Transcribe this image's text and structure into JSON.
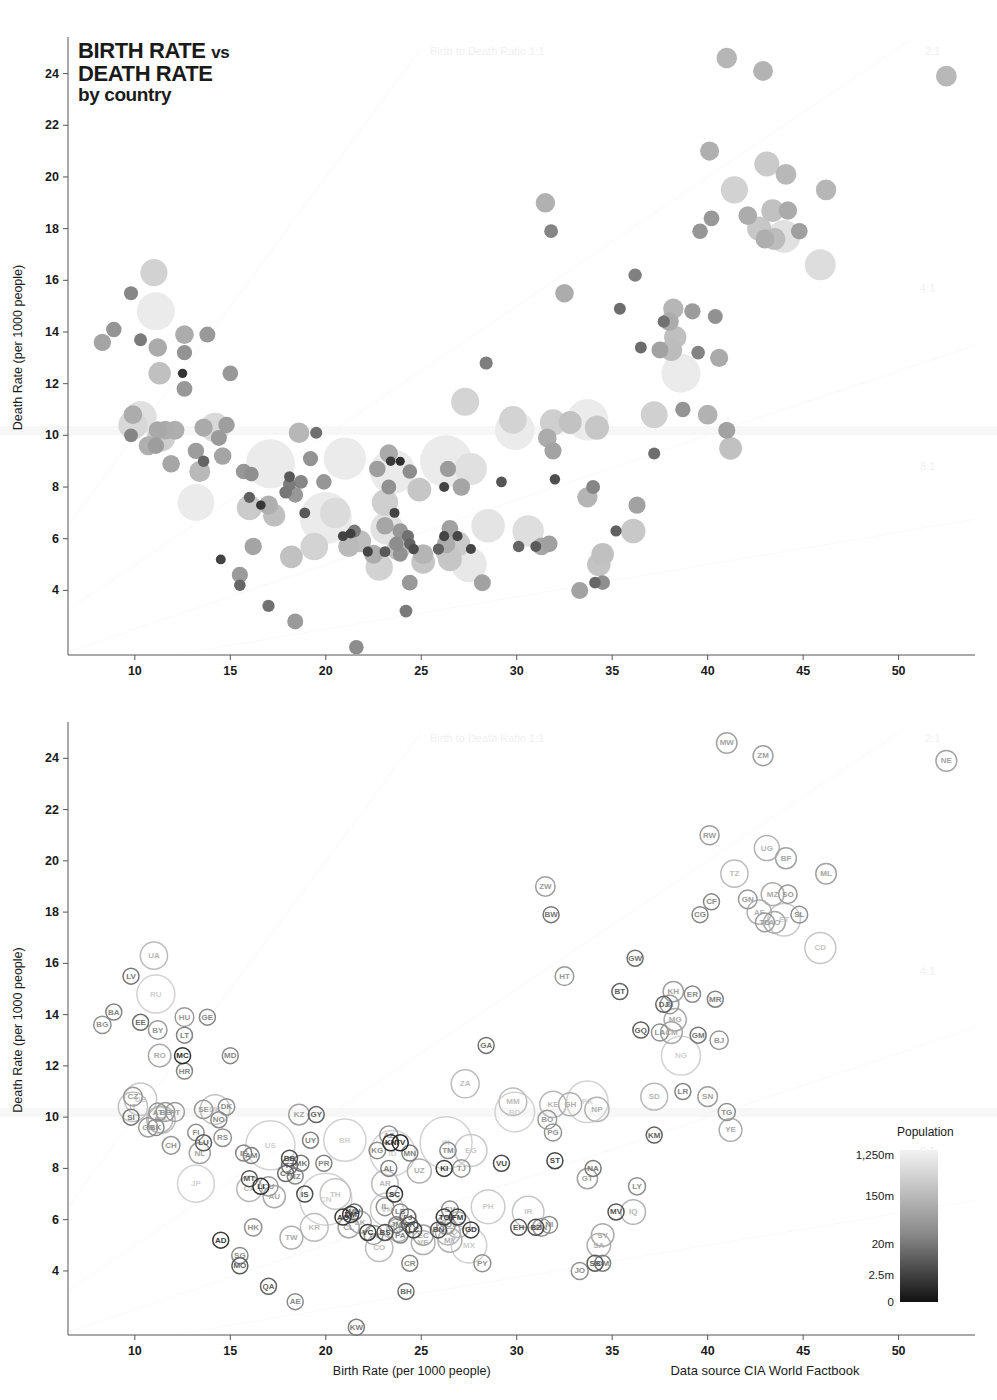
{
  "title": {
    "line1": "BIRTH RATE",
    "vs": "vs",
    "line2": "DEATH RATE",
    "line3": "by country"
  },
  "axes": {
    "x_label": "Birth Rate (per 1000 people)",
    "y_label": "Death Rate (per 1000 people)",
    "x_ticks": [
      10,
      15,
      20,
      25,
      30,
      35,
      40,
      45,
      50
    ],
    "y_ticks": [
      4,
      6,
      8,
      10,
      12,
      14,
      16,
      18,
      20,
      22,
      24
    ],
    "xlim": [
      6.5,
      54
    ],
    "ylim": [
      1.5,
      25.3
    ]
  },
  "source": "Data source CIA World Factbook",
  "ratio_lines": [
    {
      "label": "Birth to Death Ratio 1:1",
      "ratio": 1
    },
    {
      "label": "2:1",
      "ratio": 2
    },
    {
      "label": "4:1",
      "ratio": 4
    },
    {
      "label": "8:1",
      "ratio": 8
    }
  ],
  "legend": {
    "title": "Population",
    "ticks": [
      "1,250m",
      "150m",
      "20m",
      "2.5m",
      "0"
    ],
    "high_color": "#f2f2f2",
    "low_color": "#111111"
  },
  "chart_data": {
    "type": "scatter",
    "title": "BIRTH RATE vs DEATH RATE by country",
    "xlabel": "Birth Rate (per 1000 people)",
    "ylabel": "Death Rate (per 1000 people)",
    "size_encoding": "population",
    "color_encoding": "population (light = large, dark = small)",
    "grid": false,
    "legend_position": "bottom-right",
    "points": [
      {
        "code": "LV",
        "x": 9.8,
        "y": 15.5,
        "pop": 2.2
      },
      {
        "code": "UA",
        "x": 11.0,
        "y": 16.3,
        "pop": 45
      },
      {
        "code": "RU",
        "x": 11.1,
        "y": 14.8,
        "pop": 140
      },
      {
        "code": "BA",
        "x": 8.9,
        "y": 14.1,
        "pop": 3.9
      },
      {
        "code": "BG",
        "x": 8.3,
        "y": 13.6,
        "pop": 7.1
      },
      {
        "code": "EE",
        "x": 10.3,
        "y": 13.7,
        "pop": 1.3
      },
      {
        "code": "BY",
        "x": 11.2,
        "y": 13.4,
        "pop": 9.6
      },
      {
        "code": "HU",
        "x": 12.6,
        "y": 13.9,
        "pop": 10
      },
      {
        "code": "LT",
        "x": 12.6,
        "y": 13.2,
        "pop": 3.5
      },
      {
        "code": "GE",
        "x": 13.8,
        "y": 13.9,
        "pop": 4.6
      },
      {
        "code": "RO",
        "x": 11.3,
        "y": 12.4,
        "pop": 22
      },
      {
        "code": "MC",
        "x": 12.5,
        "y": 12.4,
        "pop": 0.03
      },
      {
        "code": "MD",
        "x": 15.0,
        "y": 12.4,
        "pop": 4.3
      },
      {
        "code": "HR",
        "x": 12.6,
        "y": 11.8,
        "pop": 4.4
      },
      {
        "code": "CZ",
        "x": 9.9,
        "y": 10.8,
        "pop": 10
      },
      {
        "code": "DE",
        "x": 10.3,
        "y": 10.7,
        "pop": 82
      },
      {
        "code": "IT",
        "x": 9.9,
        "y": 10.4,
        "pop": 58
      },
      {
        "code": "SI",
        "x": 9.8,
        "y": 10.0,
        "pop": 2
      },
      {
        "code": "GR",
        "x": 10.7,
        "y": 9.6,
        "pop": 11
      },
      {
        "code": "SK",
        "x": 11.1,
        "y": 9.6,
        "pop": 5.4
      },
      {
        "code": "AT",
        "x": 11.2,
        "y": 10.2,
        "pop": 8.2
      },
      {
        "code": "BE",
        "x": 11.6,
        "y": 10.2,
        "pop": 10.4
      },
      {
        "code": "PT",
        "x": 12.1,
        "y": 10.2,
        "pop": 10.6
      },
      {
        "code": "ES",
        "x": 11.4,
        "y": 9.9,
        "pop": 45
      },
      {
        "code": "PL",
        "x": 11.3,
        "y": 9.9,
        "pop": 38
      },
      {
        "code": "SE",
        "x": 13.6,
        "y": 10.3,
        "pop": 9.1
      },
      {
        "code": "UK",
        "x": 14.2,
        "y": 10.3,
        "pop": 61
      },
      {
        "code": "DK",
        "x": 14.8,
        "y": 10.4,
        "pop": 5.5
      },
      {
        "code": "NO",
        "x": 14.4,
        "y": 9.9,
        "pop": 4.7
      },
      {
        "code": "CH",
        "x": 11.9,
        "y": 8.9,
        "pop": 7.6
      },
      {
        "code": "FI",
        "x": 13.2,
        "y": 9.4,
        "pop": 5.3
      },
      {
        "code": "LU",
        "x": 13.6,
        "y": 9.0,
        "pop": 0.5
      },
      {
        "code": "NL",
        "x": 13.4,
        "y": 8.6,
        "pop": 16.6
      },
      {
        "code": "RS",
        "x": 14.6,
        "y": 9.2,
        "pop": 7.4
      },
      {
        "code": "IE",
        "x": 15.7,
        "y": 8.6,
        "pop": 4.2
      },
      {
        "code": "AM",
        "x": 16.1,
        "y": 8.5,
        "pop": 3
      },
      {
        "code": "US",
        "x": 17.1,
        "y": 8.9,
        "pop": 310
      },
      {
        "code": "KZ",
        "x": 18.6,
        "y": 10.1,
        "pop": 15.4
      },
      {
        "code": "GY",
        "x": 19.5,
        "y": 10.1,
        "pop": 0.77
      },
      {
        "code": "UY",
        "x": 19.2,
        "y": 9.1,
        "pop": 3.5
      },
      {
        "code": "BR",
        "x": 21.0,
        "y": 9.1,
        "pop": 195
      },
      {
        "code": "BB",
        "x": 18.1,
        "y": 8.4,
        "pop": 0.28
      },
      {
        "code": "TT",
        "x": 18.1,
        "y": 8.1,
        "pop": 1.3
      },
      {
        "code": "MK",
        "x": 18.7,
        "y": 8.2,
        "pop": 2.1
      },
      {
        "code": "CY",
        "x": 17.9,
        "y": 7.8,
        "pop": 1.1
      },
      {
        "code": "NZ",
        "x": 18.4,
        "y": 7.7,
        "pop": 4.3
      },
      {
        "code": "PR",
        "x": 19.9,
        "y": 8.2,
        "pop": 4
      },
      {
        "code": "MT",
        "x": 16.0,
        "y": 7.6,
        "pop": 0.4
      },
      {
        "code": "CA",
        "x": 16.0,
        "y": 7.2,
        "pop": 34
      },
      {
        "code": "LI",
        "x": 16.6,
        "y": 7.3,
        "pop": 0.035
      },
      {
        "code": "CU",
        "x": 17.0,
        "y": 7.3,
        "pop": 11.2
      },
      {
        "code": "AU",
        "x": 17.3,
        "y": 6.9,
        "pop": 21
      },
      {
        "code": "JP",
        "x": 13.2,
        "y": 7.4,
        "pop": 127
      },
      {
        "code": "IS",
        "x": 18.9,
        "y": 7.0,
        "pop": 0.3
      },
      {
        "code": "CN",
        "x": 20.0,
        "y": 6.8,
        "pop": 1340
      },
      {
        "code": "TH",
        "x": 20.5,
        "y": 7.0,
        "pop": 67
      },
      {
        "code": "MU",
        "x": 21.5,
        "y": 6.3,
        "pop": 1.3
      },
      {
        "code": "HK",
        "x": 16.2,
        "y": 5.7,
        "pop": 7
      },
      {
        "code": "AG",
        "x": 20.9,
        "y": 6.1,
        "pop": 0.087
      },
      {
        "code": "DM",
        "x": 21.3,
        "y": 6.2,
        "pop": 0.072
      },
      {
        "code": "CL",
        "x": 21.2,
        "y": 5.7,
        "pop": 17
      },
      {
        "code": "LK",
        "x": 21.8,
        "y": 5.9,
        "pop": 20
      },
      {
        "code": "VC",
        "x": 22.2,
        "y": 5.5,
        "pop": 0.1
      },
      {
        "code": "KR",
        "x": 19.4,
        "y": 5.7,
        "pop": 48
      },
      {
        "code": "TW",
        "x": 18.2,
        "y": 5.3,
        "pop": 23
      },
      {
        "code": "SG",
        "x": 15.5,
        "y": 4.6,
        "pop": 5
      },
      {
        "code": "MO",
        "x": 15.5,
        "y": 4.2,
        "pop": 0.55
      },
      {
        "code": "AD",
        "x": 14.5,
        "y": 5.2,
        "pop": 0.084
      },
      {
        "code": "IL",
        "x": 23.1,
        "y": 6.5,
        "pop": 7.6
      },
      {
        "code": "AR",
        "x": 23.1,
        "y": 7.4,
        "pop": 41
      },
      {
        "code": "SC",
        "x": 23.6,
        "y": 7.0,
        "pop": 0.09
      },
      {
        "code": "AL",
        "x": 23.3,
        "y": 8.0,
        "pop": 3.2
      },
      {
        "code": "UZ",
        "x": 24.9,
        "y": 7.9,
        "pop": 28
      },
      {
        "code": "AZ",
        "x": 23.3,
        "y": 9.3,
        "pop": 8.9
      },
      {
        "code": "KN",
        "x": 23.4,
        "y": 9.0,
        "pop": 0.05
      },
      {
        "code": "TV",
        "x": 23.9,
        "y": 9.0,
        "pop": 0.01
      },
      {
        "code": "KG",
        "x": 22.7,
        "y": 8.7,
        "pop": 5.5
      },
      {
        "code": "ID",
        "x": 23.5,
        "y": 8.6,
        "pop": 240
      },
      {
        "code": "MN",
        "x": 24.4,
        "y": 8.6,
        "pop": 2.8
      },
      {
        "code": "IN",
        "x": 26.3,
        "y": 9.0,
        "pop": 1180
      },
      {
        "code": "TM",
        "x": 26.4,
        "y": 8.7,
        "pop": 5.1
      },
      {
        "code": "EG",
        "x": 27.6,
        "y": 8.7,
        "pop": 80
      },
      {
        "code": "KI",
        "x": 26.2,
        "y": 8.0,
        "pop": 0.1
      },
      {
        "code": "TJ",
        "x": 27.1,
        "y": 8.0,
        "pop": 7.3
      },
      {
        "code": "VU",
        "x": 29.2,
        "y": 8.2,
        "pop": 0.24
      },
      {
        "code": "VN",
        "x": 23.2,
        "y": 6.4,
        "pop": 87
      },
      {
        "code": "LB",
        "x": 23.9,
        "y": 6.3,
        "pop": 4.1
      },
      {
        "code": "FJ",
        "x": 24.3,
        "y": 6.1,
        "pop": 0.85
      },
      {
        "code": "SR",
        "x": 24.4,
        "y": 5.8,
        "pop": 0.49
      },
      {
        "code": "LC",
        "x": 24.6,
        "y": 5.6,
        "pop": 0.17
      },
      {
        "code": "JM",
        "x": 23.7,
        "y": 5.8,
        "pop": 2.8
      },
      {
        "code": "BS",
        "x": 23.1,
        "y": 5.5,
        "pop": 0.31
      },
      {
        "code": "KP",
        "x": 23.8,
        "y": 5.6,
        "pop": 24
      },
      {
        "code": "PA",
        "x": 23.9,
        "y": 5.4,
        "pop": 3.4
      },
      {
        "code": "EC",
        "x": 25.1,
        "y": 5.4,
        "pop": 14
      },
      {
        "code": "VE",
        "x": 25.1,
        "y": 5.1,
        "pop": 27
      },
      {
        "code": "TN",
        "x": 22.5,
        "y": 5.4,
        "pop": 10.4
      },
      {
        "code": "CO",
        "x": 22.8,
        "y": 4.9,
        "pop": 46
      },
      {
        "code": "CR",
        "x": 24.4,
        "y": 4.3,
        "pop": 4.5
      },
      {
        "code": "SV",
        "x": 26.5,
        "y": 6.4,
        "pop": 6.2
      },
      {
        "code": "TO",
        "x": 26.2,
        "y": 6.1,
        "pop": 0.1
      },
      {
        "code": "FM",
        "x": 26.9,
        "y": 6.1,
        "pop": 0.11
      },
      {
        "code": "DO",
        "x": 26.3,
        "y": 5.8,
        "pop": 9.8
      },
      {
        "code": "DZ",
        "x": 26.9,
        "y": 5.8,
        "pop": 35
      },
      {
        "code": "GD",
        "x": 27.6,
        "y": 5.6,
        "pop": 0.11
      },
      {
        "code": "MA",
        "x": 26.4,
        "y": 5.5,
        "pop": 32
      },
      {
        "code": "MY",
        "x": 26.5,
        "y": 5.2,
        "pop": 28
      },
      {
        "code": "BN",
        "x": 25.9,
        "y": 5.6,
        "pop": 0.4
      },
      {
        "code": "MX",
        "x": 27.5,
        "y": 5.0,
        "pop": 112
      },
      {
        "code": "PY",
        "x": 28.2,
        "y": 4.3,
        "pop": 6.4
      },
      {
        "code": "PH",
        "x": 28.5,
        "y": 6.5,
        "pop": 94
      },
      {
        "code": "IR",
        "x": 30.6,
        "y": 6.3,
        "pop": 75
      },
      {
        "code": "EH",
        "x": 30.1,
        "y": 5.7,
        "pop": 0.5
      },
      {
        "code": "BZ",
        "x": 31.0,
        "y": 5.7,
        "pop": 0.31
      },
      {
        "code": "HN",
        "x": 31.3,
        "y": 5.7,
        "pop": 7.9
      },
      {
        "code": "NI",
        "x": 31.7,
        "y": 5.8,
        "pop": 5.9
      },
      {
        "code": "ST",
        "x": 32.0,
        "y": 8.3,
        "pop": 0.17
      },
      {
        "code": "GA",
        "x": 28.4,
        "y": 12.8,
        "pop": 1.5
      },
      {
        "code": "ZA",
        "x": 27.3,
        "y": 11.3,
        "pop": 50
      },
      {
        "code": "MM",
        "x": 29.8,
        "y": 10.6,
        "pop": 48
      },
      {
        "code": "BD",
        "x": 29.9,
        "y": 10.2,
        "pop": 160
      },
      {
        "code": "KE",
        "x": 31.9,
        "y": 10.5,
        "pop": 40
      },
      {
        "code": "GH",
        "x": 32.8,
        "y": 10.5,
        "pop": 24
      },
      {
        "code": "PK",
        "x": 33.7,
        "y": 10.6,
        "pop": 185
      },
      {
        "code": "NP",
        "x": 34.2,
        "y": 10.3,
        "pop": 29
      },
      {
        "code": "BO",
        "x": 31.6,
        "y": 9.9,
        "pop": 10
      },
      {
        "code": "PG",
        "x": 31.9,
        "y": 9.4,
        "pop": 6.7
      },
      {
        "code": "ZW",
        "x": 31.5,
        "y": 19.0,
        "pop": 12
      },
      {
        "code": "BW",
        "x": 31.8,
        "y": 17.9,
        "pop": 2
      },
      {
        "code": "HT",
        "x": 32.5,
        "y": 15.5,
        "pop": 9.8
      },
      {
        "code": "BT",
        "x": 35.4,
        "y": 14.9,
        "pop": 0.7
      },
      {
        "code": "GW",
        "x": 36.2,
        "y": 16.2,
        "pop": 1.6
      },
      {
        "code": "GQ",
        "x": 36.5,
        "y": 13.4,
        "pop": 0.68
      },
      {
        "code": "KH",
        "x": 38.2,
        "y": 14.9,
        "pop": 14.5
      },
      {
        "code": "DJ",
        "x": 37.7,
        "y": 14.4,
        "pop": 0.87
      },
      {
        "code": "BI",
        "x": 38.0,
        "y": 14.4,
        "pop": 9.9
      },
      {
        "code": "ER",
        "x": 39.2,
        "y": 14.8,
        "pop": 5.2
      },
      {
        "code": "MG",
        "x": 38.3,
        "y": 13.8,
        "pop": 21
      },
      {
        "code": "LA",
        "x": 37.5,
        "y": 13.3,
        "pop": 6.4
      },
      {
        "code": "CM",
        "x": 38.1,
        "y": 13.3,
        "pop": 19
      },
      {
        "code": "GM",
        "x": 39.5,
        "y": 13.2,
        "pop": 1.8
      },
      {
        "code": "MR",
        "x": 40.4,
        "y": 14.6,
        "pop": 3.2
      },
      {
        "code": "BJ",
        "x": 40.6,
        "y": 13.0,
        "pop": 9
      },
      {
        "code": "NG",
        "x": 38.6,
        "y": 12.4,
        "pop": 152
      },
      {
        "code": "LR",
        "x": 38.7,
        "y": 11.0,
        "pop": 3.7
      },
      {
        "code": "SD",
        "x": 37.2,
        "y": 10.8,
        "pop": 43
      },
      {
        "code": "SN",
        "x": 40.0,
        "y": 10.8,
        "pop": 12.6
      },
      {
        "code": "TG",
        "x": 41.0,
        "y": 10.2,
        "pop": 6.6
      },
      {
        "code": "YE",
        "x": 41.2,
        "y": 9.5,
        "pop": 23
      },
      {
        "code": "KM",
        "x": 37.2,
        "y": 9.3,
        "pop": 0.75
      },
      {
        "code": "NA",
        "x": 34.0,
        "y": 8.0,
        "pop": 2.1
      },
      {
        "code": "GT",
        "x": 33.7,
        "y": 7.6,
        "pop": 14
      },
      {
        "code": "LY",
        "x": 36.3,
        "y": 7.3,
        "pop": 6.5
      },
      {
        "code": "MV",
        "x": 35.2,
        "y": 6.3,
        "pop": 0.4
      },
      {
        "code": "IQ",
        "x": 36.1,
        "y": 6.3,
        "pop": 31
      },
      {
        "code": "SY",
        "x": 34.5,
        "y": 5.4,
        "pop": 22
      },
      {
        "code": "SA",
        "x": 34.3,
        "y": 5.0,
        "pop": 26
      },
      {
        "code": "SB",
        "x": 34.1,
        "y": 4.3,
        "pop": 0.56
      },
      {
        "code": "OM",
        "x": 34.5,
        "y": 4.3,
        "pop": 3
      },
      {
        "code": "JO",
        "x": 33.3,
        "y": 4.0,
        "pop": 6.4
      },
      {
        "code": "QA",
        "x": 17.0,
        "y": 3.4,
        "pop": 0.84
      },
      {
        "code": "AE",
        "x": 18.4,
        "y": 2.8,
        "pop": 4.7
      },
      {
        "code": "BH",
        "x": 24.2,
        "y": 3.2,
        "pop": 1.2
      },
      {
        "code": "KW",
        "x": 21.6,
        "y": 1.8,
        "pop": 2.8
      },
      {
        "code": "MW",
        "x": 41.0,
        "y": 24.6,
        "pop": 15
      },
      {
        "code": "ZM",
        "x": 42.9,
        "y": 24.1,
        "pop": 13
      },
      {
        "code": "NE",
        "x": 52.5,
        "y": 23.9,
        "pop": 15.9
      },
      {
        "code": "RW",
        "x": 40.1,
        "y": 21.0,
        "pop": 11
      },
      {
        "code": "UG",
        "x": 43.1,
        "y": 20.5,
        "pop": 33
      },
      {
        "code": "BF",
        "x": 44.1,
        "y": 20.1,
        "pop": 16
      },
      {
        "code": "TZ",
        "x": 41.4,
        "y": 19.5,
        "pop": 45
      },
      {
        "code": "ML",
        "x": 46.2,
        "y": 19.5,
        "pop": 15
      },
      {
        "code": "GN",
        "x": 42.1,
        "y": 18.5,
        "pop": 10
      },
      {
        "code": "MZ",
        "x": 43.4,
        "y": 18.7,
        "pop": 23
      },
      {
        "code": "SO",
        "x": 44.2,
        "y": 18.7,
        "pop": 9.4
      },
      {
        "code": "CF",
        "x": 40.2,
        "y": 18.4,
        "pop": 4.4
      },
      {
        "code": "CG",
        "x": 39.6,
        "y": 17.9,
        "pop": 4
      },
      {
        "code": "AF",
        "x": 42.7,
        "y": 18.0,
        "pop": 29
      },
      {
        "code": "TD",
        "x": 43.0,
        "y": 17.6,
        "pop": 10.5
      },
      {
        "code": "AO",
        "x": 43.5,
        "y": 17.6,
        "pop": 19
      },
      {
        "code": "ET",
        "x": 44.0,
        "y": 17.7,
        "pop": 85
      },
      {
        "code": "SL",
        "x": 44.8,
        "y": 17.9,
        "pop": 5.8
      },
      {
        "code": "CD",
        "x": 45.9,
        "y": 16.6,
        "pop": 71
      }
    ]
  }
}
